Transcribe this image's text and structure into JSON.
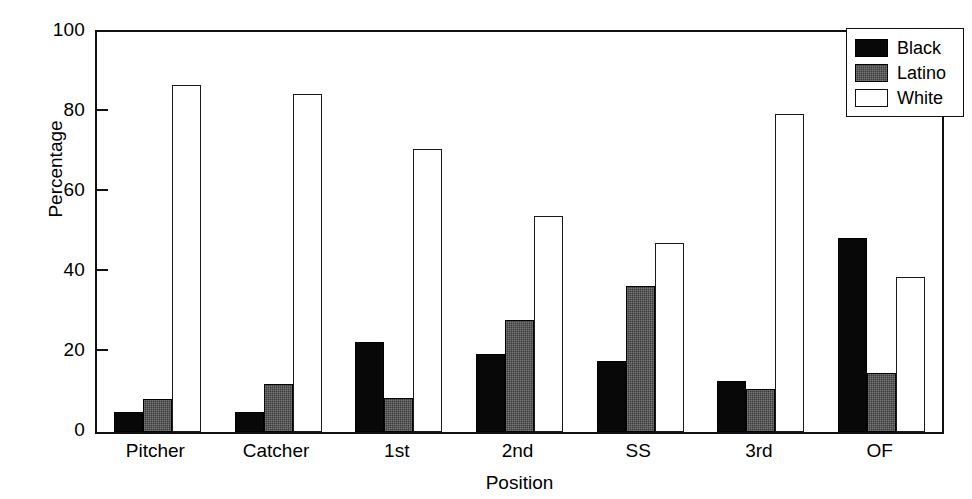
{
  "chart_data": {
    "type": "bar",
    "title": "",
    "xlabel": "Position",
    "ylabel": "Percentage",
    "ylim": [
      0,
      100
    ],
    "yticks": [
      0,
      20,
      40,
      60,
      80,
      100
    ],
    "grid": false,
    "legend_position": "top-right",
    "categories": [
      "Pitcher",
      "Catcher",
      "1st",
      "2nd",
      "SS",
      "3rd",
      "OF"
    ],
    "series": [
      {
        "name": "Black",
        "color": "#080808",
        "values": [
          5.0,
          5.1,
          22.6,
          19.5,
          17.7,
          12.8,
          48.4
        ]
      },
      {
        "name": "Latino",
        "color": "#3b3b3b",
        "values": [
          8.3,
          12.1,
          8.5,
          28.0,
          36.4,
          10.8,
          14.8
        ]
      },
      {
        "name": "White",
        "color": "#ffffff",
        "values": [
          86.8,
          84.4,
          70.7,
          53.9,
          47.3,
          79.4,
          38.7
        ]
      }
    ]
  }
}
